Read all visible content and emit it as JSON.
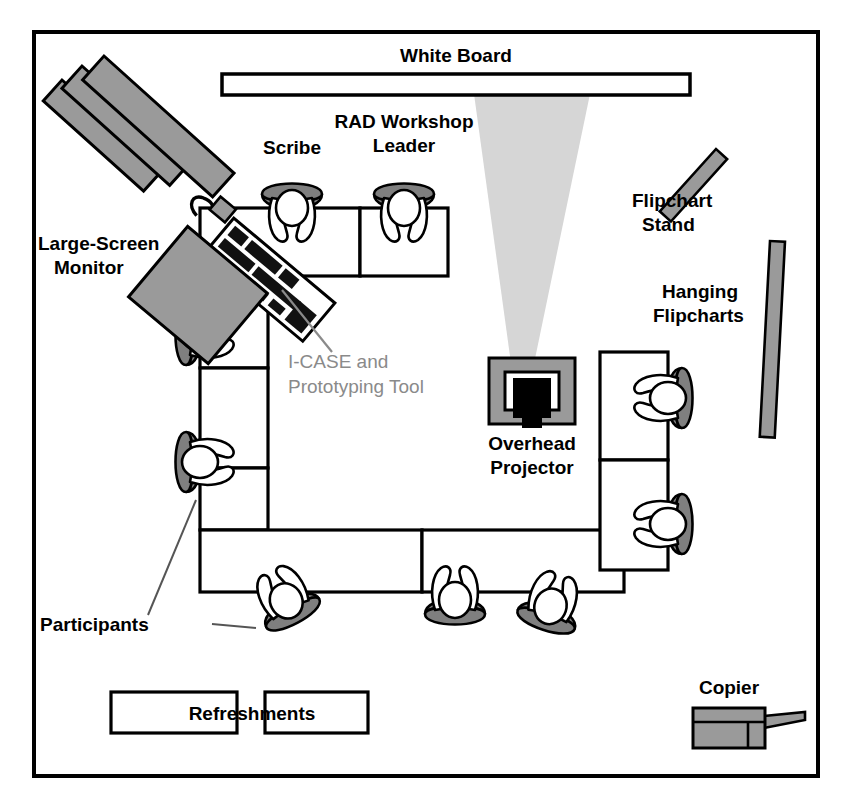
{
  "diagram": {
    "title_context": "RAD workshop room layout floor plan",
    "background_color": "#ffffff",
    "frame_color": "#000000",
    "ink_color": "#000000",
    "fill_gray": "#9a9a9a",
    "fill_gray_light": "#cfcfcf",
    "beam_color": "#d4d4d4",
    "annotation_gray": "#8a8a8a"
  },
  "labels": {
    "white_board": "White Board",
    "scribe": "Scribe",
    "rad_leader_line1": "RAD Workshop",
    "rad_leader_line2": "Leader",
    "large_screen_line1": "Large-Screen",
    "large_screen_line2": "Monitor",
    "icase_line1": "I-CASE and",
    "icase_line2": "Prototyping Tool",
    "flipchart_stand_line1": "Flipchart",
    "flipchart_stand_line2": "Stand",
    "hanging_flipcharts_line1": "Hanging",
    "hanging_flipcharts_line2": "Flipcharts",
    "overhead_projector_line1": "Overhead",
    "overhead_projector_line2": "Projector",
    "participants": "Participants",
    "refreshments": "Refreshments",
    "copier": "Copier"
  },
  "objects": {
    "frame": {
      "x": 34,
      "y": 32,
      "width": 784,
      "height": 744
    },
    "white_board": {
      "x": 222,
      "y": 74,
      "width": 468,
      "height": 20
    },
    "projector_beam": {
      "top_left_x": 474,
      "top_right_x": 590,
      "bottom_left_x": 513,
      "bottom_right_x": 531,
      "top_y": 94,
      "bottom_y": 378
    },
    "overhead_projector": {
      "x": 487,
      "y": 358,
      "width": 88,
      "height": 68
    },
    "large_screen_monitor": {
      "bars": 3,
      "angle_deg": -42
    },
    "flipchart_stand": {
      "x": 713,
      "y": 150,
      "width": 14,
      "height": 76,
      "angle_deg": 42
    },
    "hanging_flipcharts": {
      "x": 765,
      "y": 241,
      "width": 14,
      "height": 196,
      "angle_deg": 0
    },
    "copier": {
      "x": 693,
      "y": 710,
      "width": 72,
      "height": 38
    },
    "refreshment_tables": [
      {
        "x": 111,
        "y": 692,
        "width": 126,
        "height": 41
      },
      {
        "x": 265,
        "y": 692,
        "width": 103,
        "height": 41
      }
    ],
    "icase_workstation": {
      "angle_deg": -40,
      "description": "monitor, keyboard and mouse on table corner"
    }
  },
  "table": {
    "shape": "U-shaped conference table",
    "outer": {
      "left": 200,
      "top": 208,
      "right": 668,
      "bottom": 570
    },
    "segments_note": "top arm, left arm, right arm and bottom arm divided into panel segments"
  },
  "people": [
    {
      "name": "scribe",
      "seat": "top-left",
      "role_label": "Scribe"
    },
    {
      "name": "rad-workshop-leader",
      "seat": "top-right",
      "role_label": "RAD Workshop Leader"
    },
    {
      "name": "participant-left-upper",
      "seat": "left",
      "role_label": "Participants"
    },
    {
      "name": "participant-left-lower",
      "seat": "left",
      "role_label": "Participants"
    },
    {
      "name": "participant-bottom-left",
      "seat": "bottom",
      "role_label": "Participants"
    },
    {
      "name": "participant-bottom-center",
      "seat": "bottom",
      "role_label": "Participants"
    },
    {
      "name": "participant-bottom-right",
      "seat": "bottom",
      "role_label": "Participants"
    },
    {
      "name": "participant-right-upper",
      "seat": "right",
      "role_label": "Participants"
    },
    {
      "name": "participant-right-lower",
      "seat": "right",
      "role_label": "Participants"
    }
  ],
  "leader_lines": [
    {
      "from": "icase-label",
      "to": "icase-workstation"
    },
    {
      "from": "participants-label",
      "to": "participant-left-lower"
    },
    {
      "from": "participants-label",
      "to": "participant-bottom-left"
    }
  ]
}
